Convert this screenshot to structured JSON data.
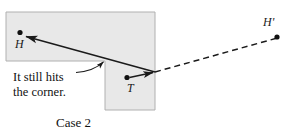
{
  "figure": {
    "caption": "Case 2",
    "annotation": {
      "line1": "It still hits",
      "line2": "the corner."
    },
    "points": [
      {
        "id": "H",
        "label": "H",
        "x": 20,
        "y": 33
      },
      {
        "id": "T",
        "label": "T",
        "x": 127,
        "y": 78
      },
      {
        "id": "Hp",
        "label": "H'",
        "x": 277,
        "y": 37
      }
    ],
    "reflection_point": {
      "x": 155,
      "y": 72
    },
    "corner_point": {
      "x": 105,
      "y": 61
    },
    "colors": {
      "shape_fill": "#e8e8e8",
      "shape_stroke": "#b0b0b0",
      "line": "#1a1a1a",
      "background": "#ffffff"
    },
    "shape": {
      "name": "inverted-L-region",
      "top_rect": {
        "x": 6,
        "y": 12,
        "width": 149,
        "height": 49
      },
      "bottom_rect": {
        "x": 105,
        "y": 61,
        "width": 50,
        "height": 49
      }
    },
    "segments": [
      {
        "name": "incoming-ray-to-H",
        "style": "solid",
        "from": [
          155,
          72
        ],
        "to": [
          24,
          36
        ],
        "arrow": "end"
      },
      {
        "name": "ray-from-T",
        "style": "solid",
        "from": [
          129,
          78
        ],
        "to": [
          155,
          72
        ],
        "arrow": "end"
      },
      {
        "name": "virtual-ray-to-H-prime",
        "style": "dashed",
        "from": [
          155,
          72
        ],
        "to": [
          276,
          38
        ],
        "arrow": "none"
      },
      {
        "name": "annotation-leader",
        "style": "solid-curved",
        "from": [
          76,
          72
        ],
        "to": [
          104,
          61
        ],
        "arrow": "end"
      }
    ]
  }
}
